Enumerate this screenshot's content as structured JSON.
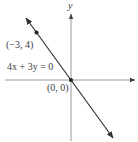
{
  "figure": {
    "type": "line-graph",
    "axes": {
      "x_label": "x",
      "y_label": "y",
      "x_label_visible": false,
      "y_label_visible": true
    },
    "line": {
      "equation": "4x + 3y = 0",
      "direction": "decreasing",
      "arrows": "both-ends"
    },
    "points": [
      {
        "label": "(−3, 4)",
        "x": -3,
        "y": 4
      },
      {
        "label": "(0, 0)",
        "x": 0,
        "y": 0
      }
    ],
    "colors": {
      "axis": "#8a8a8a",
      "line": "#333333",
      "text": "#3a3a3a"
    }
  }
}
